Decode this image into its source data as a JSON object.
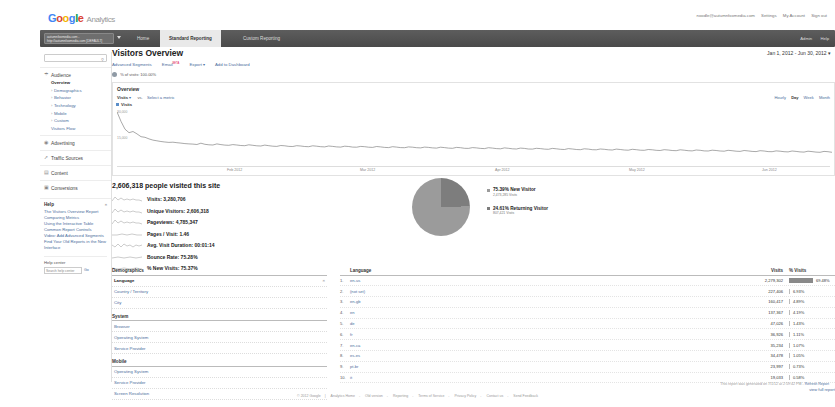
{
  "brand": {
    "google": "Google",
    "product": "Analytics"
  },
  "account_links": {
    "email": "noodle@autumnfoxmedia.com",
    "settings": "Settings",
    "my_account": "My Account",
    "sign_out": "Sign out"
  },
  "nav": {
    "account_selector": "autumnfoxmedia.com - http://autumnfoxmedia.com [DEFAULT]",
    "tabs": [
      {
        "label": "Home",
        "active": false
      },
      {
        "label": "Standard Reporting",
        "active": true
      },
      {
        "label": "Custom Reporting",
        "active": false
      }
    ],
    "admin": "Admin",
    "help": "Help"
  },
  "sidebar": {
    "search_placeholder": "",
    "search_icon": "search-icon",
    "groups": [
      {
        "name": "Audience",
        "icon": "audience-icon",
        "items": [
          {
            "label": "Overview",
            "selected": true,
            "expandable": false
          },
          {
            "label": "Demographics",
            "selected": false,
            "expandable": true
          },
          {
            "label": "Behavior",
            "selected": false,
            "expandable": true
          },
          {
            "label": "Technology",
            "selected": false,
            "expandable": true
          },
          {
            "label": "Mobile",
            "selected": false,
            "expandable": true
          },
          {
            "label": "Custom",
            "selected": false,
            "expandable": true
          },
          {
            "label": "Visitors Flow",
            "selected": false,
            "expandable": false
          }
        ]
      },
      {
        "name": "Advertising",
        "icon": "advertising-icon",
        "items": []
      },
      {
        "name": "Traffic Sources",
        "icon": "traffic-icon",
        "items": []
      },
      {
        "name": "Content",
        "icon": "content-icon",
        "items": []
      },
      {
        "name": "Conversions",
        "icon": "conversions-icon",
        "items": []
      }
    ],
    "help": {
      "title": "Help",
      "close": "×",
      "links": [
        "The Visitors Overview Report",
        "Comparing Metrics",
        "Using the Interactive Table",
        "Common Report Controls",
        "Video: Add Advanced Segments",
        "Find Your Old Reports in the New Interface"
      ],
      "center_label": "Help center",
      "search_value": "Search help center",
      "go": "Go"
    }
  },
  "page": {
    "title": "Visitors Overview",
    "date_range": "Jan 1, 2012 - Jun 30, 2012",
    "date_caret": "▾",
    "toolbar": [
      {
        "label": "Advanced Segments",
        "beta": ""
      },
      {
        "label": "Email",
        "beta": "BETA"
      },
      {
        "label": "Export",
        "beta": ""
      },
      {
        "label": "Add to Dashboard",
        "beta": ""
      }
    ],
    "segment_line": "% of visits: 100.00%"
  },
  "chart_panel": {
    "heading": "Overview",
    "metric_selected": "Visits",
    "metric_caret": "▾",
    "vs_label": "vs.",
    "vs_metric": "Select a metric",
    "granularity": [
      {
        "label": "Hourly",
        "on": false
      },
      {
        "label": "Day",
        "on": true
      },
      {
        "label": "Week",
        "on": false
      },
      {
        "label": "Month",
        "on": false
      }
    ],
    "legend": "Visits"
  },
  "chart_data": {
    "type": "line",
    "title": "Visits",
    "xlabel": "",
    "ylabel": "Visits",
    "ylim": [
      0,
      30000
    ],
    "yticks": [
      30000,
      15000
    ],
    "ytick_labels": [
      "30,000",
      "15,000"
    ],
    "xtick_labels": [
      "Feb 2012",
      "Mar 2012",
      "Apr 2012",
      "May 2012",
      "Jun 2012"
    ],
    "grid": false,
    "series": [
      {
        "name": "Visits",
        "values": [
          29500,
          24000,
          19500,
          17500,
          18200,
          16800,
          15200,
          14800,
          13900,
          13200,
          12800,
          12400,
          12100,
          11900,
          12000,
          11700,
          11500,
          11200,
          11000,
          10900,
          10700,
          11400,
          10800,
          10500,
          10400,
          11000,
          10600,
          10300,
          10200,
          10600,
          10400,
          10100,
          10000,
          10500,
          10200,
          9900,
          9800,
          10300,
          10000,
          9700,
          9600,
          10100,
          9900,
          9600,
          9500,
          10000,
          9800,
          9500,
          9400,
          9900,
          9700,
          9400,
          9300,
          9800,
          9600,
          9300,
          9200,
          9700,
          9500,
          9200,
          9100,
          9600,
          9400,
          9100,
          9000,
          9500,
          9300,
          9000,
          8900,
          9400,
          9200,
          8900,
          8800,
          9300,
          9100,
          8800,
          8700,
          9200,
          9000,
          8700,
          8600,
          9100,
          8900,
          8600,
          8500,
          9000,
          8800,
          8500,
          8400,
          8900,
          8700,
          8400,
          8300,
          8800,
          8600,
          8300,
          8200,
          8700,
          8500,
          8200,
          8100,
          8600,
          8400,
          8100,
          8000,
          8500,
          8300,
          8000,
          7900,
          8400,
          8200,
          7900,
          7800,
          8300,
          8100,
          7800,
          7700,
          8200,
          8000,
          7700,
          7600,
          8100,
          7900,
          7600,
          7500,
          8000,
          7800,
          7500,
          7400,
          7900,
          7700,
          7400,
          7300,
          7800,
          7600,
          7300,
          7200,
          7700,
          7500,
          7200,
          7100,
          7600,
          7400,
          7100,
          7000,
          7500,
          7300,
          7000,
          6900,
          7400,
          7200,
          6900,
          6800,
          7300,
          7100,
          6800,
          6700,
          7200,
          7000,
          6700,
          6600,
          7100,
          6900,
          6600,
          6500,
          7000,
          6800,
          6500,
          6400,
          6900,
          6700,
          6400,
          6300,
          6800,
          6600,
          6300,
          6200,
          6700,
          6500,
          6200
        ]
      }
    ]
  },
  "summary": {
    "headline": "2,606,318 people visited this site",
    "metrics": [
      {
        "label": "Visits: 3,280,706"
      },
      {
        "label": "Unique Visitors: 2,606,318"
      },
      {
        "label": "Pageviews: 4,785,347"
      },
      {
        "label": "Pages / Visit: 1.46"
      },
      {
        "label": "Avg. Visit Duration: 00:01:14"
      },
      {
        "label": "Bounce Rate: 75.28%"
      },
      {
        "label": "% New Visits: 75.37%"
      }
    ]
  },
  "pie_data": {
    "type": "pie",
    "title": "New vs Returning",
    "slices": [
      {
        "label": "New Visitor",
        "percent": "75.39%",
        "sub": "2,473,285 Visits",
        "value": 75.39,
        "color": "#9b9b9b"
      },
      {
        "label": "Returning Visitor",
        "percent": "24.61%",
        "sub": "807,421 Visits",
        "value": 24.61,
        "color": "#7d7d7d"
      }
    ]
  },
  "dimension_nav": {
    "groups": [
      {
        "title": "Demographics",
        "items": [
          {
            "label": "Language",
            "active": true,
            "close": "×"
          },
          {
            "label": "Country / Territory",
            "active": false
          },
          {
            "label": "City",
            "active": false
          }
        ]
      },
      {
        "title": "System",
        "items": [
          {
            "label": "Browser",
            "active": false
          },
          {
            "label": "Operating System",
            "active": false
          },
          {
            "label": "Service Provider",
            "active": false
          }
        ]
      },
      {
        "title": "Mobile",
        "items": [
          {
            "label": "Operating System",
            "active": false
          },
          {
            "label": "Service Provider",
            "active": false
          },
          {
            "label": "Screen Resolution",
            "active": false
          }
        ]
      }
    ]
  },
  "report_table": {
    "columns": {
      "index": "",
      "dimension": "Language",
      "visits": "Visits",
      "pct": "% Visits"
    },
    "rows": [
      {
        "idx": "1.",
        "name": "en-us",
        "visits": "2,279,302",
        "pct": "69.48%",
        "bar": 100
      },
      {
        "idx": "2.",
        "name": "(not set)",
        "visits": "227,406",
        "pct": "6.93%",
        "bar": 0
      },
      {
        "idx": "3.",
        "name": "en-gb",
        "visits": "160,417",
        "pct": "4.89%",
        "bar": 0
      },
      {
        "idx": "4.",
        "name": "en",
        "visits": "137,367",
        "pct": "4.19%",
        "bar": 0
      },
      {
        "idx": "5.",
        "name": "de",
        "visits": "47,026",
        "pct": "1.43%",
        "bar": 0
      },
      {
        "idx": "6.",
        "name": "fr",
        "visits": "36,926",
        "pct": "1.11%",
        "bar": 0
      },
      {
        "idx": "7.",
        "name": "en-ca",
        "visits": "35,234",
        "pct": "1.07%",
        "bar": 0
      },
      {
        "idx": "8.",
        "name": "es-es",
        "visits": "34,478",
        "pct": "1.05%",
        "bar": 0
      },
      {
        "idx": "9.",
        "name": "pt-br",
        "visits": "23,997",
        "pct": "0.73%",
        "bar": 0
      },
      {
        "idx": "10.",
        "name": "it",
        "visits": "19,033",
        "pct": "0.58%",
        "bar": 0
      }
    ],
    "view_full": "view full report"
  },
  "footer": {
    "generated": "This report was generated on 7/1/12 at 2:59:42 PM -",
    "refresh": "Refresh Report",
    "copyright": "© 2012 Google",
    "links": [
      "Analytics Home",
      "Old version",
      "Reporting",
      "Terms of Service",
      "Privacy Policy",
      "Contact us",
      "Send Feedback"
    ]
  }
}
